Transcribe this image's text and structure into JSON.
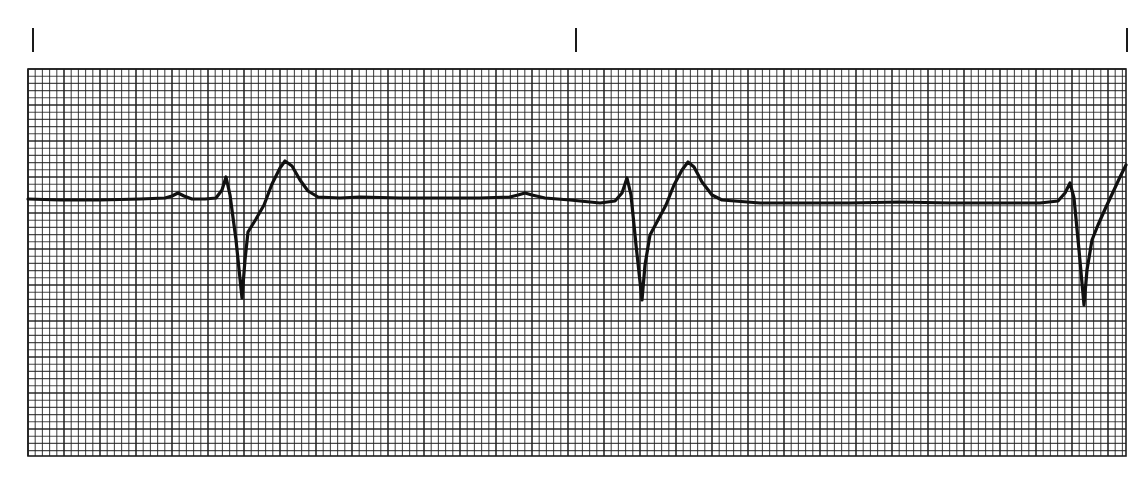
{
  "chart_data": {
    "type": "line",
    "title": "",
    "subtitle": "",
    "xlabel": "",
    "ylabel": "",
    "grid": true,
    "grid_spec": {
      "small_square_px": 7.2,
      "large_square_px": 36,
      "small_per_large": 5
    },
    "time_markers_x": [
      33,
      576,
      1127
    ],
    "strip_bounds": {
      "left": 28,
      "top": 69,
      "right": 1126,
      "bottom": 456
    },
    "series": [
      {
        "name": "ECG trace",
        "points": [
          [
            28,
            199
          ],
          [
            60,
            200
          ],
          [
            100,
            200
          ],
          [
            140,
            199
          ],
          [
            165,
            198
          ],
          [
            172,
            196
          ],
          [
            178,
            193
          ],
          [
            184,
            196
          ],
          [
            192,
            199
          ],
          [
            205,
            199
          ],
          [
            216,
            198
          ],
          [
            222,
            190
          ],
          [
            226,
            177
          ],
          [
            230,
            195
          ],
          [
            236,
            240
          ],
          [
            242,
            298
          ],
          [
            245,
            260
          ],
          [
            248,
            232
          ],
          [
            256,
            219
          ],
          [
            264,
            205
          ],
          [
            272,
            184
          ],
          [
            280,
            168
          ],
          [
            285,
            161
          ],
          [
            292,
            166
          ],
          [
            300,
            180
          ],
          [
            308,
            191
          ],
          [
            318,
            197
          ],
          [
            340,
            198
          ],
          [
            360,
            197
          ],
          [
            400,
            198
          ],
          [
            440,
            198
          ],
          [
            480,
            198
          ],
          [
            510,
            197
          ],
          [
            518,
            195
          ],
          [
            525,
            193
          ],
          [
            532,
            195
          ],
          [
            545,
            198
          ],
          [
            570,
            200
          ],
          [
            600,
            203
          ],
          [
            615,
            201
          ],
          [
            622,
            193
          ],
          [
            627,
            178
          ],
          [
            631,
            195
          ],
          [
            636,
            245
          ],
          [
            642,
            300
          ],
          [
            645,
            265
          ],
          [
            650,
            235
          ],
          [
            658,
            220
          ],
          [
            666,
            205
          ],
          [
            674,
            185
          ],
          [
            682,
            170
          ],
          [
            688,
            162
          ],
          [
            694,
            167
          ],
          [
            702,
            182
          ],
          [
            712,
            195
          ],
          [
            722,
            200
          ],
          [
            760,
            203
          ],
          [
            800,
            203
          ],
          [
            850,
            203
          ],
          [
            900,
            202
          ],
          [
            950,
            203
          ],
          [
            1000,
            203
          ],
          [
            1040,
            203
          ],
          [
            1058,
            201
          ],
          [
            1065,
            193
          ],
          [
            1070,
            183
          ],
          [
            1074,
            198
          ],
          [
            1079,
            250
          ],
          [
            1084,
            305
          ],
          [
            1087,
            270
          ],
          [
            1092,
            240
          ],
          [
            1098,
            225
          ],
          [
            1106,
            207
          ],
          [
            1114,
            190
          ],
          [
            1120,
            177
          ],
          [
            1126,
            165
          ]
        ]
      }
    ],
    "annotations": [
      {
        "label": "R wave",
        "x": [
          226,
          627,
          1070
        ]
      },
      {
        "label": "S wave",
        "x": [
          242,
          642,
          1084
        ]
      },
      {
        "label": "T wave",
        "x": [
          285,
          688
        ]
      }
    ],
    "colors": {
      "trace": "#111111",
      "grid": "#1e1e1e",
      "paper": "#ffffff",
      "tick": "#1a1a1a"
    }
  },
  "strip": {
    "aria_label": "ECG rhythm strip"
  }
}
